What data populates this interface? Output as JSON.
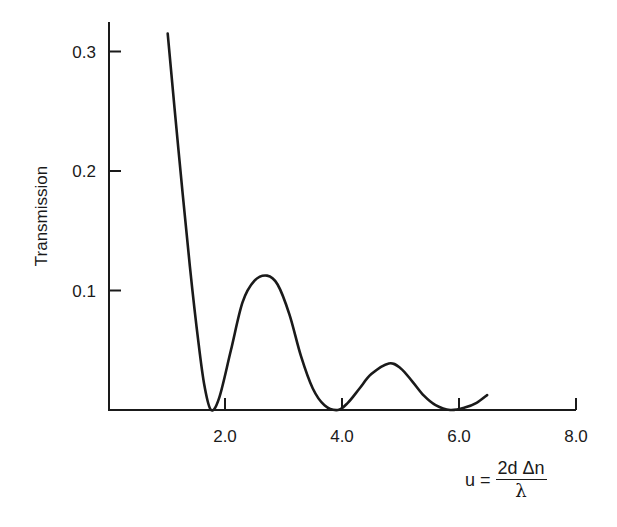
{
  "chart_data": {
    "type": "line",
    "title": "",
    "xlabel": "u = 2d Δn / λ",
    "ylabel": "Transmission",
    "xlim": [
      0,
      8.0
    ],
    "ylim": [
      0,
      0.33
    ],
    "grid": false,
    "legend": null,
    "x_ticks": [
      "2.0",
      "4.0",
      "6.0",
      "8.0"
    ],
    "y_ticks": [
      "0.1",
      "0.2",
      "0.3"
    ],
    "series": [
      {
        "name": "Transmission",
        "x": [
          1.02,
          1.2,
          1.4,
          1.55,
          1.65,
          1.76,
          1.9,
          2.1,
          2.3,
          2.5,
          2.72,
          2.9,
          3.1,
          3.3,
          3.5,
          3.7,
          3.93,
          4.1,
          4.3,
          4.5,
          4.8,
          5.0,
          5.2,
          5.4,
          5.6,
          5.85,
          6.1,
          6.3,
          6.48
        ],
        "values": [
          0.315,
          0.22,
          0.12,
          0.055,
          0.02,
          0.0,
          0.01,
          0.05,
          0.09,
          0.108,
          0.1125,
          0.105,
          0.08,
          0.045,
          0.018,
          0.004,
          0.0,
          0.006,
          0.018,
          0.03,
          0.039,
          0.035,
          0.024,
          0.012,
          0.004,
          0.0,
          0.002,
          0.006,
          0.0125
        ]
      }
    ],
    "annotations": []
  },
  "labels": {
    "ylabel": "Transmission",
    "x_prefix": "u =",
    "x_numerator": "2d Δn",
    "x_denominator": "λ"
  }
}
